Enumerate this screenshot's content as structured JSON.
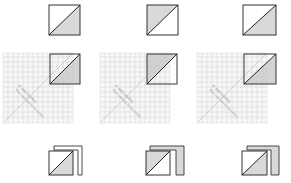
{
  "diagram": {
    "type": "quilting-instruction",
    "colors": {
      "outline": "#333333",
      "shade": "#d9d9d9",
      "ruler_line": "#cccccc",
      "ruler_bg": "#f7f7f7"
    },
    "columns": [
      {
        "id": "col-1",
        "step1": {
          "shaded_half": "lower-right"
        },
        "ruler": {
          "label": "4\" BIAS SQUARE",
          "sublabel": "Trim oversize for accuracy"
        },
        "result": {
          "shaded_half": "lower-right",
          "strip_shaded": false
        }
      },
      {
        "id": "col-2",
        "step1": {
          "shaded_half": "upper-left"
        },
        "ruler": {
          "label": "4\" BIAS SQUARE",
          "sublabel": "Trim oversize for accuracy"
        },
        "result": {
          "shaded_half": "upper-left",
          "strip_shaded": true
        }
      },
      {
        "id": "col-3",
        "step1": {
          "shaded_half": "lower-right"
        },
        "ruler": {
          "label": "4\" BIAS SQUARE",
          "sublabel": "Trim oversize for accuracy"
        },
        "result": {
          "shaded_half": "lower-right",
          "strip_shaded": true
        }
      }
    ]
  }
}
